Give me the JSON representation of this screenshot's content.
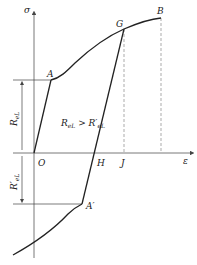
{
  "diagram": {
    "type": "stress-strain curve (Bauschinger effect)",
    "axes": {
      "y_label": "σ",
      "x_label": "ε",
      "origin_label": "O"
    },
    "points": {
      "A": "A",
      "G": "G",
      "B": "B",
      "H": "H",
      "J": "J",
      "A_prime": "A′"
    },
    "annotations": {
      "upper_dimension": {
        "main": "R",
        "sub": "eL"
      },
      "lower_dimension": {
        "main": "R′",
        "sub": "eL"
      },
      "relation": {
        "left_main": "R",
        "left_sub": "eL",
        "op": " > ",
        "right_main": "R′",
        "right_sub": "eL"
      }
    },
    "colors": {
      "line": "#222222",
      "axis": "#555555",
      "dashed": "#888888"
    }
  }
}
